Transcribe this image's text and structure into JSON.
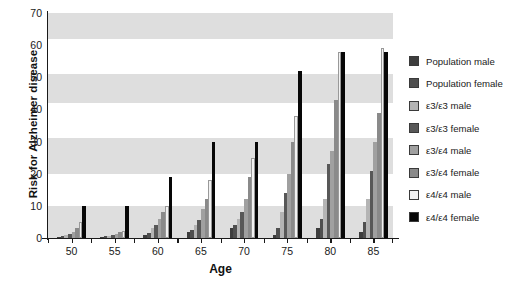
{
  "chart_data": {
    "type": "bar",
    "title": "",
    "xlabel": "Age",
    "ylabel": "Risk for Alzheimer disease",
    "categories": [
      "50",
      "55",
      "60",
      "65",
      "70",
      "75",
      "80",
      "85"
    ],
    "ylim": [
      0,
      70
    ],
    "yticks": [
      0,
      10,
      20,
      30,
      40,
      50,
      60,
      70
    ],
    "grid": false,
    "legend_position": "right",
    "banded_background": true,
    "series": [
      {
        "name": "Population male",
        "color": "#3d3d3d",
        "values": [
          0.4,
          0.3,
          1.0,
          2.0,
          3.0,
          1.0,
          3.0,
          2.0
        ]
      },
      {
        "name": "Population female",
        "color": "#4f4f4f",
        "values": [
          0.6,
          0.5,
          1.5,
          2.5,
          4.0,
          3.0,
          6.0,
          5.0
        ]
      },
      {
        "name": "ε3/ε3 male",
        "color": "#b4b4b4",
        "values": [
          1.0,
          0.7,
          3.0,
          4.0,
          6.0,
          8.0,
          12.0,
          12.0
        ]
      },
      {
        "name": "ε3/ε3 female",
        "color": "#585858",
        "values": [
          1.4,
          1.0,
          4.0,
          5.5,
          8.0,
          14.0,
          23.0,
          21.0
        ]
      },
      {
        "name": "ε3/ε4 male",
        "color": "#a0a0a0",
        "values": [
          2.0,
          1.3,
          6.0,
          9.0,
          12.0,
          20.0,
          27.0,
          30.0
        ]
      },
      {
        "name": "ε3/ε4 female",
        "color": "#8a8a8a",
        "values": [
          3.0,
          1.8,
          8.0,
          12.0,
          19.0,
          30.0,
          43.0,
          39.0
        ]
      },
      {
        "name": "ε4/ε4 male",
        "color": "#f2f2f2",
        "values": [
          5.0,
          2.2,
          10.0,
          18.0,
          25.0,
          38.0,
          58.0,
          59.0
        ]
      },
      {
        "name": "ε4/ε4 female",
        "color": "#070707",
        "values": [
          10.0,
          10.0,
          19.0,
          30.0,
          30.0,
          52.0,
          58.0,
          58.0
        ]
      }
    ]
  }
}
